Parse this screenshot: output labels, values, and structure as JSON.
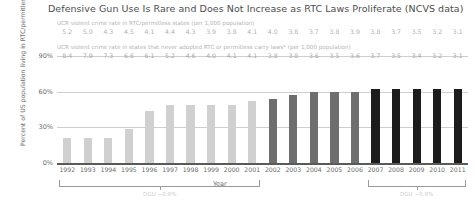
{
  "chart_data": {
    "type": "bar",
    "title": "Defensive Gun Use Is Rare and Does Not Increase as RTC Laws Proliferate (NCVS data)",
    "xlabel": "Year",
    "ylabel": "Percent of US population living in RTC/permitless states",
    "ylim": [
      0,
      100
    ],
    "yticks": [
      "0%",
      "30%",
      "60%",
      "90%"
    ],
    "ytick_values": [
      0,
      30,
      60,
      90
    ],
    "grid": true,
    "legend": "none",
    "categories": [
      "1992",
      "1993",
      "1994",
      "1995",
      "1996",
      "1997",
      "1998",
      "1999",
      "2000",
      "2001",
      "2002",
      "2003",
      "2004",
      "2005",
      "2006",
      "2007",
      "2008",
      "2009",
      "2010",
      "2011"
    ],
    "values": [
      21,
      21,
      21,
      29,
      44,
      49,
      49,
      49,
      49,
      52,
      54,
      57,
      60,
      60,
      60,
      62,
      62,
      62,
      62,
      62
    ],
    "bar_colors": [
      "#d0d0d0",
      "#d0d0d0",
      "#d0d0d0",
      "#d0d0d0",
      "#d0d0d0",
      "#d0d0d0",
      "#d0d0d0",
      "#d0d0d0",
      "#d0d0d0",
      "#d0d0d0",
      "#6e6e6e",
      "#6e6e6e",
      "#6e6e6e",
      "#6e6e6e",
      "#6e6e6e",
      "#1c1c1c",
      "#1c1c1c",
      "#1c1c1c",
      "#1c1c1c",
      "#1c1c1c"
    ],
    "annotation_rows": [
      {
        "caption": "UCR violent crime rate in RTC/permitless states (per 1,000 population)",
        "values": [
          "5.2",
          "5.0",
          "4.3",
          "4.5",
          "4.1",
          "4.4",
          "4.3",
          "3.9",
          "3.8",
          "4.1",
          "4.0",
          "3.8",
          "3.7",
          "3.8",
          "3.9",
          "3.8",
          "3.7",
          "3.5",
          "3.2",
          "3.1"
        ]
      },
      {
        "caption": "UCR violent crime rate in states that never adopted RTC or permitless carry laws* (per 1,000 population)",
        "values": [
          "8.4",
          "7.9",
          "7.3",
          "6.6",
          "6.1",
          "5.2",
          "4.6",
          "4.0",
          "4.1",
          "4.1",
          "3.8",
          "3.8",
          "3.6",
          "3.5",
          "3.6",
          "3.7",
          "3.5",
          "3.4",
          "3.2",
          "3.1"
        ]
      }
    ],
    "brackets": [
      {
        "label": "DGU ~0.9%",
        "start_index": 0,
        "end_index": 9
      },
      {
        "label": "DGU ~0.8%",
        "start_index": 15,
        "end_index": 19
      }
    ]
  }
}
